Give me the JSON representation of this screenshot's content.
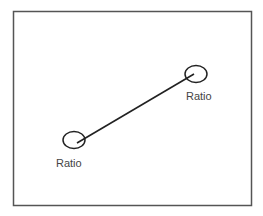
{
  "diagram": {
    "frame": {
      "x": 13,
      "y": 11,
      "width": 238,
      "height": 194,
      "stroke": "#555555"
    },
    "nodes": [
      {
        "id": "node-upper",
        "label": "Ratio",
        "cx": 196,
        "cy": 74,
        "rx": 11,
        "ry": 8.5,
        "label_x": 186,
        "label_y": 100
      },
      {
        "id": "node-lower",
        "label": "Ratio",
        "cx": 74,
        "cy": 140,
        "rx": 11,
        "ry": 8.5,
        "label_x": 56,
        "label_y": 167
      }
    ],
    "edge": {
      "from": "node-lower",
      "to": "node-upper",
      "x1": 77,
      "y1": 143,
      "x2": 194,
      "y2": 74,
      "stroke": "#222222"
    }
  }
}
